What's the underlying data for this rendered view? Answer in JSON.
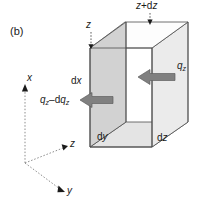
{
  "figure": {
    "panel_label": "(b)",
    "type": "control-volume-diagram"
  },
  "colors": {
    "ink": "#1a1a1a",
    "arrow_fill": "#808080",
    "arrow_stroke": "#595959",
    "face_left": "#d2d2d2",
    "face_right": "#eaeaea",
    "face_top": "#ffffff",
    "face_bottom": "#e4e4e4",
    "edge": "#4d4d4d",
    "axis": "#8c8c8c",
    "background": "#ffffff"
  },
  "labels": {
    "position_near": {
      "base": "z",
      "sub": ""
    },
    "position_far": {
      "base": "z",
      "op": "+",
      "delta": "d",
      "var": "z"
    },
    "flux_in": {
      "base": "q",
      "sub": "z"
    },
    "flux_out": {
      "base": "q",
      "sub": "z",
      "op": "–",
      "d": "d",
      "base2": "q",
      "sub2": "z"
    },
    "dim_x": {
      "d": "d",
      "var": "x"
    },
    "dim_y": {
      "d": "d",
      "var": "y"
    },
    "dim_z": {
      "d": "d",
      "var": "z"
    }
  },
  "axes": {
    "x_label": "x",
    "y_label": "y",
    "z_label": "z"
  },
  "text": {
    "panel": "(b)",
    "z_near": "z",
    "z_far_z": "z",
    "z_far_plus": "+",
    "z_far_d": "d",
    "z_far_var": "z",
    "qz_q": "q",
    "qz_sub": "z",
    "qout_q": "q",
    "qout_sub": "z",
    "qout_minus": "–",
    "qout_d": "d",
    "qout_q2": "q",
    "qout_sub2": "z",
    "dx_d": "d",
    "dx_var": "x",
    "dy_d": "d",
    "dy_var": "y",
    "dz_d": "d",
    "dz_var": "z",
    "axis_x": "x",
    "axis_y": "y",
    "axis_z": "z"
  }
}
